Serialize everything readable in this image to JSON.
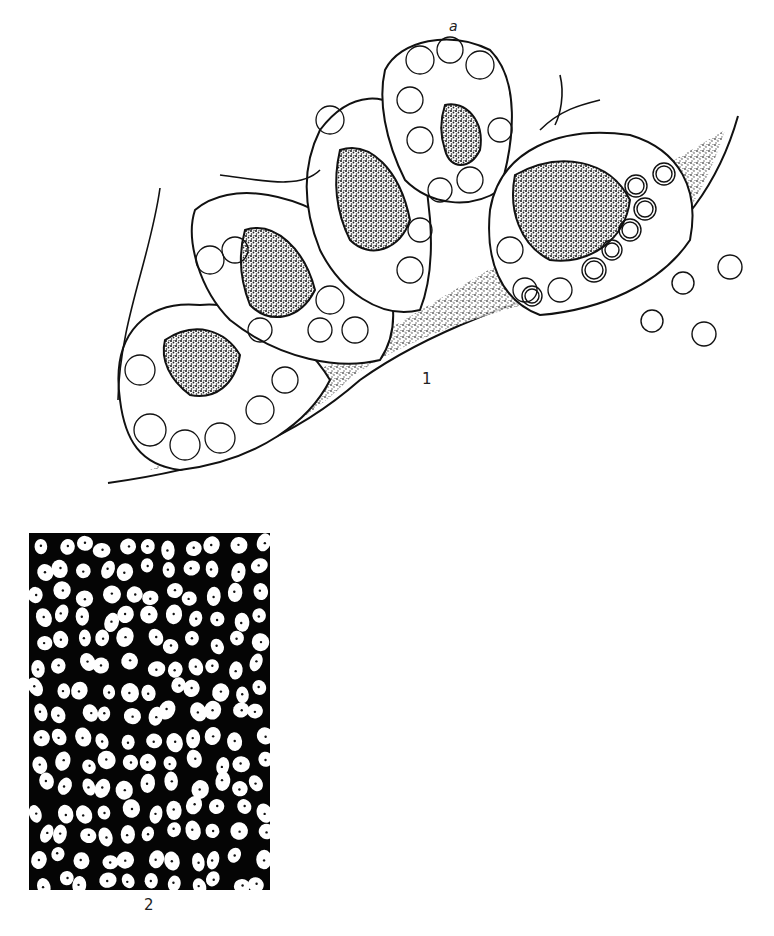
{
  "figure": {
    "panel1": {
      "label": "1",
      "annotation": "a",
      "description": "Line drawing of glandular lobules: acini of pale cells surrounding stippled lumina, bordered by stippled connective tissue; secretory granules shown as ring-shaped circles at right"
    },
    "panel2": {
      "label": "2",
      "description": "Black field with scattered white oval cells, each with a small dark dot (nucleus)"
    },
    "colors": {
      "ink": "#111111",
      "background": "#ffffff",
      "stipple": "#555555"
    }
  }
}
